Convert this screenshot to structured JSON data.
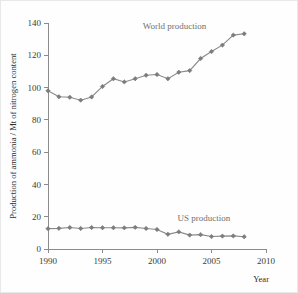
{
  "chart_data": {
    "type": "line",
    "title": "",
    "xlabel": "Year",
    "ylabel": "Production of ammonia / Mt of nitrogen content",
    "xlim": [
      1990,
      2010
    ],
    "ylim": [
      0,
      140
    ],
    "xticks": [
      1990,
      1995,
      2000,
      2005,
      2010
    ],
    "yticks": [
      0,
      20,
      40,
      60,
      80,
      100,
      120,
      140
    ],
    "grid": false,
    "legend_position": "inline-annotations",
    "line_color": "#8a8a8a",
    "marker_color": "#7d7d7d",
    "axis_color": "#8b8b8b",
    "x": [
      1990,
      1991,
      1992,
      1993,
      1994,
      1995,
      1996,
      1997,
      1998,
      1999,
      2000,
      2001,
      2002,
      2003,
      2004,
      2005,
      2006,
      2007,
      2008
    ],
    "series": [
      {
        "name": "World production",
        "label": "World production",
        "label_x": 2001.6,
        "label_y": 136,
        "values": [
          98,
          94.3,
          94,
          92.2,
          94.2,
          100.7,
          105.5,
          103.5,
          105.5,
          107.6,
          108.1,
          105.5,
          109.5,
          110.5,
          118,
          122.3,
          126.3,
          132.5,
          133.3
        ]
      },
      {
        "name": "US production",
        "label": "US production",
        "label_x": 2004.3,
        "label_y": 17.6,
        "values": [
          12.6,
          12.8,
          13.3,
          12.7,
          13.3,
          13.2,
          13.2,
          13.1,
          13.4,
          12.7,
          12.1,
          9.1,
          10.6,
          8.6,
          8.9,
          7.7,
          8.0,
          8.1,
          7.6
        ]
      }
    ]
  }
}
